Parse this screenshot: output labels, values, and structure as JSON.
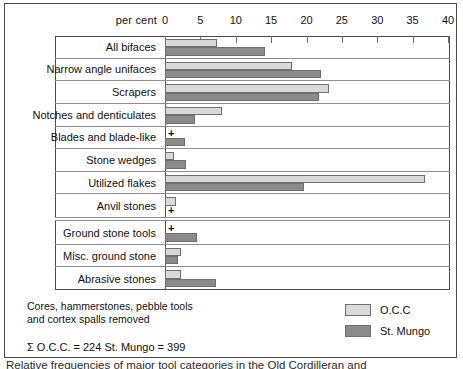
{
  "axis": {
    "unit_label": "per cent",
    "ticks": [
      0,
      5,
      10,
      15,
      20,
      25,
      30,
      35,
      40
    ],
    "min": 0,
    "max": 40
  },
  "legend": {
    "items": [
      {
        "label": "O.C.C",
        "color": "#d9d9d9",
        "key": "occ"
      },
      {
        "label": "St. Mungo",
        "color": "#8b8b8b",
        "key": "mungo"
      }
    ]
  },
  "notes": {
    "line1": "Cores, hammerstones, pebble tools",
    "line2": "and cortex spalls removed",
    "totals": "Σ O.C.C. = 224   St. Mungo = 399"
  },
  "caption": "Relative frequencies of major tool categories in the Old Cordilleran and",
  "chart_data": {
    "type": "bar",
    "orientation": "horizontal",
    "title": "",
    "xlabel": "per cent",
    "ylabel": "",
    "xlim": [
      0,
      40
    ],
    "xticks": [
      0,
      5,
      10,
      15,
      20,
      25,
      30,
      35,
      40
    ],
    "grid": false,
    "legend_position": "bottom-right",
    "categories": [
      "All bifaces",
      "Narrow angle unifaces",
      "Scrapers",
      "Notches and denticulates",
      "Blades and blade-like",
      "Stone wedges",
      "Utilized flakes",
      "Anvil stones",
      "Ground stone tools",
      "Misc. ground stone",
      "Abrasive stones"
    ],
    "group_break_after": "Anvil stones",
    "series": [
      {
        "name": "O.C.C",
        "color": "#d9d9d9",
        "values": [
          7.4,
          18.0,
          23.2,
          8.0,
          0.0,
          1.3,
          36.8,
          1.6,
          0.0,
          2.3,
          2.3
        ],
        "trace_flags": [
          false,
          false,
          false,
          false,
          true,
          false,
          false,
          false,
          true,
          false,
          false
        ]
      },
      {
        "name": "St. Mungo",
        "color": "#8b8b8b",
        "values": [
          14.2,
          22.0,
          21.8,
          4.3,
          2.8,
          3.0,
          19.6,
          0.0,
          4.5,
          1.8,
          7.2
        ],
        "trace_flags": [
          false,
          false,
          false,
          false,
          false,
          false,
          false,
          false,
          false,
          false,
          false
        ]
      }
    ],
    "annotations": [
      {
        "text": "+",
        "category": "Blades and blade-like",
        "series": "O.C.C"
      },
      {
        "text": "+",
        "category": "Anvil stones",
        "series": "St. Mungo"
      }
    ]
  }
}
